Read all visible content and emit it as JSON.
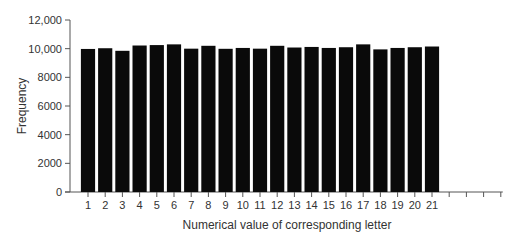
{
  "chart_data": {
    "type": "bar",
    "title": "",
    "xlabel": "Numerical value of corresponding letter",
    "ylabel": "Frequency",
    "ylim": [
      0,
      12000
    ],
    "yticks": [
      0,
      2000,
      4000,
      6000,
      8000,
      10000,
      12000
    ],
    "ytick_labels": [
      "0",
      "2000",
      "4000",
      "6000",
      "8000",
      "10,000",
      "12,000"
    ],
    "categories": [
      "1",
      "2",
      "3",
      "4",
      "5",
      "6",
      "7",
      "8",
      "9",
      "10",
      "11",
      "12",
      "13",
      "14",
      "15",
      "16",
      "17",
      "18",
      "19",
      "20",
      "21"
    ],
    "values": [
      9980,
      10030,
      9850,
      10220,
      10250,
      10300,
      10000,
      10200,
      9990,
      10050,
      10000,
      10200,
      10080,
      10120,
      10050,
      10100,
      10300,
      9950,
      10050,
      10100,
      10150
    ],
    "extra_empty_ticks": 4,
    "grid": false,
    "legend": null,
    "bar_color": "#0a0a0a"
  }
}
